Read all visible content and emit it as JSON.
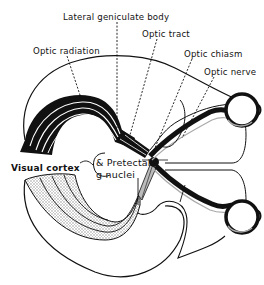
{
  "figure": {
    "type": "anatomical-diagram",
    "colors": {
      "ink": "#111111",
      "background": "#ffffff",
      "stipple": "#c8c8c8"
    }
  },
  "labels": {
    "lateral_geniculate_body": "Lateral geniculate body",
    "optic_tract": "Optic tract",
    "optic_radiation": "Optic radiation",
    "optic_chiasm": "Optic chiasm",
    "optic_nerve": "Optic nerve",
    "visual_cortex": "Visual cortex",
    "pretectal_line1": "& Pretectal",
    "pretectal_line2": "g nuclei"
  }
}
